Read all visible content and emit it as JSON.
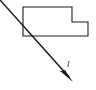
{
  "figure": {
    "background_color": "#ffffff",
    "stroke_color": "#1a1a1a",
    "width": 96,
    "height": 90,
    "shape": {
      "name": "stepped-rectangle",
      "fill_color": "#ffffff",
      "stroke_color": "#1a1a1a",
      "stroke_width": 1.1,
      "points": "23,7 72,7 72,22 88,22 88,36 23,36"
    },
    "vector": {
      "name": "incident-arrow",
      "stroke_color": "#1a1a1a",
      "stroke_width": 1.5,
      "start_x": 0,
      "start_y": 0,
      "end_x": 72,
      "end_y": 80,
      "arrowhead_points": "72,81 62,70 66,69 62,64",
      "label": "l",
      "label_x": 68,
      "label_y": 66
    }
  }
}
